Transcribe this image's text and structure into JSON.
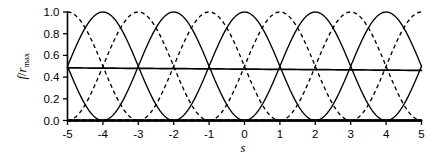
{
  "chart_data": {
    "type": "line",
    "title": "",
    "xlabel": "s",
    "ylabel": "f/r_max",
    "ylabel_parts": {
      "numerator": "f",
      "slash": "/",
      "denominator": "r",
      "subscript": "max"
    },
    "xlim": [
      -5,
      5
    ],
    "ylim": [
      0.0,
      1.0
    ],
    "grid": false,
    "legend": null,
    "xticks": [
      -5,
      -4,
      -3,
      -2,
      -1,
      0,
      1,
      2,
      3,
      4,
      5
    ],
    "xtick_labels": [
      "-5",
      "-4",
      "-3",
      "-2",
      "-1",
      "0",
      "1",
      "2",
      "3",
      "4",
      "5"
    ],
    "yticks": [
      0.0,
      0.2,
      0.4,
      0.6,
      0.8,
      1.0
    ],
    "ytick_labels": [
      "0.0",
      "0.2",
      "0.4",
      "0.6",
      "0.8",
      "1.0"
    ],
    "colors": {
      "curve": "#000000",
      "axis": "#000000",
      "background": "#ffffff"
    },
    "curve_period": 4,
    "curve_peak": 1.0,
    "curve_form": "cos^2(pi*(s-c)/4) for |s-c| <= 2, else 0",
    "series": [
      {
        "name": "basis-center--6",
        "style": "solid",
        "center": -6,
        "peak": 1.0,
        "peak_visible": false
      },
      {
        "name": "basis-center--5",
        "style": "dashed",
        "center": -5,
        "peak": 1.0,
        "peak_visible": true
      },
      {
        "name": "basis-center--4",
        "style": "solid",
        "center": -4,
        "peak": 1.0,
        "peak_visible": true
      },
      {
        "name": "basis-center--3",
        "style": "dashed",
        "center": -3,
        "peak": 1.0,
        "peak_visible": true
      },
      {
        "name": "basis-center--2",
        "style": "solid",
        "center": -2,
        "peak": 1.0,
        "peak_visible": true
      },
      {
        "name": "basis-center--1",
        "style": "dashed",
        "center": -1,
        "peak": 1.0,
        "peak_visible": true
      },
      {
        "name": "basis-center-0",
        "style": "solid",
        "center": 0,
        "peak": 1.0,
        "peak_visible": true
      },
      {
        "name": "basis-center-1",
        "style": "dashed",
        "center": 1,
        "peak": 1.0,
        "peak_visible": true
      },
      {
        "name": "basis-center-2",
        "style": "solid",
        "center": 2,
        "peak": 1.0,
        "peak_visible": true
      },
      {
        "name": "basis-center-3",
        "style": "dashed",
        "center": 3,
        "peak": 1.0,
        "peak_visible": true
      },
      {
        "name": "basis-center-4",
        "style": "solid",
        "center": 4,
        "peak": 1.0,
        "peak_visible": true
      },
      {
        "name": "basis-center-5",
        "style": "dashed",
        "center": 5,
        "peak": 1.0,
        "peak_visible": true
      },
      {
        "name": "basis-center-6",
        "style": "solid",
        "center": 6,
        "peak": 1.0,
        "peak_visible": false
      }
    ],
    "sum_curve": {
      "name": "sum-curve",
      "style": "solid",
      "label": "",
      "value_center": 0.485,
      "value_left_edge": 0.485,
      "value_right_edge": 0.462,
      "note": "nearly flat horizontal line slightly below 0.5"
    },
    "edge_values": {
      "left_edge_s": -5,
      "left_edge_solid_f": 0.6,
      "left_edge_dashed_f": 0.14,
      "right_edge_s": 5,
      "right_edge_solid_f": 0.6,
      "right_edge_dashed_f": 0.13
    }
  }
}
